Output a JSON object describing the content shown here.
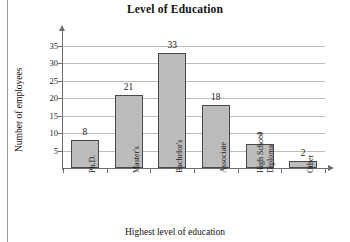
{
  "chart_data": {
    "type": "bar",
    "title": "Level of Education",
    "xlabel": "Highest level of education",
    "ylabel": "Number of employees",
    "categories": [
      "Ph.D.",
      "Master's",
      "Bachelor's",
      "Associate",
      "High School Diploma",
      "Other"
    ],
    "category_lines": [
      [
        "Ph.D."
      ],
      [
        "Master's"
      ],
      [
        "Bachelor's"
      ],
      [
        "Associate"
      ],
      [
        "High School",
        "Diploma"
      ],
      [
        "Other"
      ]
    ],
    "values": [
      8,
      21,
      33,
      18,
      7,
      2
    ],
    "value_labels": [
      "8",
      "21",
      "33",
      "18",
      "7",
      "2"
    ],
    "ylim": [
      0,
      36
    ],
    "yticks": [
      5,
      10,
      15,
      20,
      25,
      30,
      35
    ],
    "ytick_labels": [
      "5",
      "10",
      "15",
      "20",
      "25",
      "30",
      "35"
    ],
    "grid": true,
    "legend": false,
    "bar_color": "#bcbcbc",
    "bar_edge_color": "#4a4a4a",
    "axis_color": "#6e6e6e",
    "grid_color": "#bdbdbd"
  }
}
